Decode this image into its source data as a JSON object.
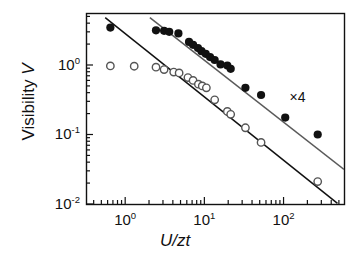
{
  "chart_data": {
    "type": "scatter",
    "title": "",
    "xlabel": "U/zt",
    "ylabel": "Visibility V",
    "xscale": "log",
    "yscale": "log",
    "xlim": [
      0.32,
      580
    ],
    "ylim": [
      0.01,
      5.6
    ],
    "grid": false,
    "legend": null,
    "xticks": [
      {
        "value": 1,
        "label": "10",
        "exp": "0"
      },
      {
        "value": 10,
        "label": "10",
        "exp": "1"
      },
      {
        "value": 100,
        "label": "10",
        "exp": "2"
      }
    ],
    "yticks": [
      {
        "value": 1,
        "label": "10",
        "exp": "0"
      },
      {
        "value": 0.1,
        "label": "10",
        "exp": "-1"
      },
      {
        "value": 0.01,
        "label": "10",
        "exp": "-2"
      }
    ],
    "annotations": [
      {
        "text": "×4",
        "x": 150,
        "y": 0.33
      }
    ],
    "series": [
      {
        "name": "filled-circles",
        "marker": "filled-circle",
        "color": "#111111",
        "points": [
          [
            0.65,
            3.45
          ],
          [
            2.45,
            3.15
          ],
          [
            3.1,
            3.1
          ],
          [
            3.6,
            3.0
          ],
          [
            4.7,
            2.85
          ],
          [
            6.4,
            2.15
          ],
          [
            7.2,
            1.95
          ],
          [
            8.3,
            1.75
          ],
          [
            9.2,
            1.58
          ],
          [
            10.4,
            1.45
          ],
          [
            11.8,
            1.3
          ],
          [
            13.5,
            1.18
          ],
          [
            16.0,
            1.02
          ],
          [
            19.5,
            0.98
          ],
          [
            21.5,
            0.88
          ],
          [
            33.0,
            0.47
          ],
          [
            52.0,
            0.37
          ],
          [
            105.0,
            0.175
          ],
          [
            270.0,
            0.1
          ]
        ]
      },
      {
        "name": "open-circles",
        "marker": "open-circle",
        "color": "#111111",
        "points": [
          [
            0.65,
            0.97
          ],
          [
            1.3,
            0.96
          ],
          [
            2.45,
            0.93
          ],
          [
            3.1,
            0.86
          ],
          [
            4.1,
            0.79
          ],
          [
            4.8,
            0.77
          ],
          [
            6.2,
            0.66
          ],
          [
            7.2,
            0.6
          ],
          [
            8.4,
            0.53
          ],
          [
            9.4,
            0.5
          ],
          [
            10.6,
            0.47
          ],
          [
            13.5,
            0.315
          ],
          [
            19.5,
            0.215
          ],
          [
            21.5,
            0.195
          ],
          [
            33.0,
            0.125
          ],
          [
            52.0,
            0.077
          ],
          [
            270.0,
            0.021
          ]
        ]
      }
    ],
    "fit_lines": [
      {
        "name": "lower-fit-line",
        "color": "#111111",
        "from": [
          0.56,
          4.8
        ],
        "to": [
          480.0,
          0.0102
        ]
      },
      {
        "name": "upper-fit-line",
        "color": "#5a5a5a",
        "from": [
          2.05,
          4.8
        ],
        "to": [
          580.0,
          0.0315
        ]
      }
    ]
  }
}
